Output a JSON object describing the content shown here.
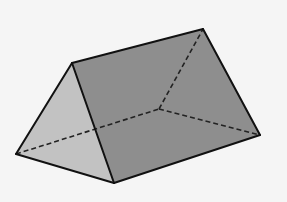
{
  "diagram": {
    "type": "triangular-prism",
    "background": "#f5f5f5",
    "colors": {
      "front_face": "#c2c2c2",
      "side_face": "#8e8e8e",
      "edge": "#111111",
      "hidden_edge": "#222222"
    },
    "vertices": {
      "front_apex": [
        72,
        63
      ],
      "back_apex": [
        203,
        29
      ],
      "front_left": [
        16,
        154
      ],
      "front_right": [
        114,
        183
      ],
      "back_right": [
        260,
        135
      ],
      "back_left_hidden": [
        159,
        109
      ]
    }
  }
}
